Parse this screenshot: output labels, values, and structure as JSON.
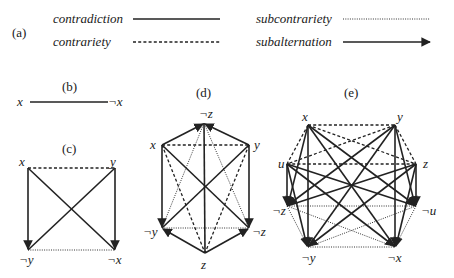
{
  "legend": {
    "panel_label": "(a)",
    "items": [
      {
        "label": "contradiction",
        "style": "solid"
      },
      {
        "label": "contrariety",
        "style": "dashed"
      },
      {
        "label": "subcontrariety",
        "style": "dotted"
      },
      {
        "label": "subalternation",
        "style": "arrow"
      }
    ]
  },
  "panel_b": {
    "label": "(b)",
    "nodes": [
      "x",
      "¬x"
    ],
    "edges": [
      {
        "from": "x",
        "to": "¬x",
        "type": "contradiction"
      }
    ]
  },
  "panel_c": {
    "label": "(c)",
    "nodes": {
      "top_left": "x",
      "top_right": "y",
      "bottom_left": "¬y",
      "bottom_right": "¬x"
    }
  },
  "panel_d": {
    "label": "(d)",
    "nodes": {
      "top": "¬z",
      "upper_left": "x",
      "upper_right": "y",
      "lower_left": "¬y",
      "lower_right": "¬z",
      "bottom": "z"
    }
  },
  "panel_e": {
    "label": "(e)",
    "nodes": {
      "x": "x",
      "y": "y",
      "u": "u",
      "z": "z",
      "nz": "¬z",
      "nu": "¬u",
      "ny": "¬y",
      "nx": "¬x"
    }
  },
  "colors": {
    "ink": "#222222",
    "background": "#ffffff"
  }
}
